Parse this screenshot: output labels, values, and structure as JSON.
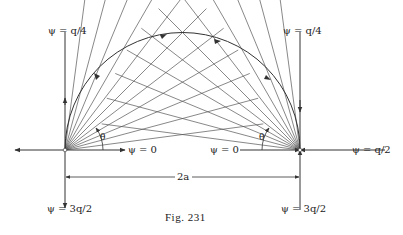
{
  "figure": {
    "caption": "Fig. 231",
    "labels": {
      "top_left": "ψ = q/4",
      "top_right": "ψ = q/4",
      "mid_left_zero": "ψ = 0",
      "mid_right_zero": "ψ = 0",
      "right_end": "ψ = q/2",
      "bottom_left": "ψ = 3q/2",
      "bottom_right": "ψ = 3q/2",
      "dimension": "2a",
      "theta_left": "θ",
      "theta_right": "θ"
    },
    "geometry": {
      "left_source": [
        65,
        150
      ],
      "right_source": [
        300,
        150
      ],
      "ray_angles_deg": [
        7.5,
        15,
        22.5,
        30,
        37.5,
        45,
        52.5,
        60,
        67.5,
        75,
        82.5
      ],
      "ray_length": 200,
      "ink_color": "#333333"
    }
  }
}
